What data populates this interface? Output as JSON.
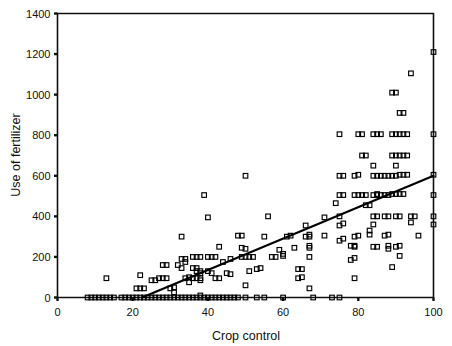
{
  "chart_data": {
    "type": "scatter",
    "title": "",
    "xlabel": "Crop control",
    "ylabel": "Use of fertilizer",
    "xlim": [
      0,
      100
    ],
    "ylim": [
      0,
      1400
    ],
    "xticks": [
      0,
      20,
      40,
      60,
      80,
      100
    ],
    "yticks": [
      0,
      200,
      400,
      600,
      800,
      1000,
      1200,
      1400
    ],
    "xtick_labels": [
      "0",
      "20",
      "40",
      "60",
      "80",
      "100"
    ],
    "ytick_labels": [
      "0",
      "200",
      "400",
      "600",
      "800",
      "1000",
      "1200",
      "1400"
    ],
    "grid": false,
    "legend": null,
    "marker": "open-square",
    "marker_color": "#000000",
    "trendline": {
      "label": "linear fit",
      "color": "#000000",
      "x_start": 22.5,
      "y_start": 0,
      "x_end": 100,
      "y_end": 600
    },
    "points": [
      [
        8,
        0
      ],
      [
        9,
        0
      ],
      [
        10,
        0
      ],
      [
        11,
        0
      ],
      [
        12,
        0
      ],
      [
        13,
        0
      ],
      [
        14,
        0
      ],
      [
        15,
        0
      ],
      [
        13,
        95
      ],
      [
        17,
        0
      ],
      [
        18,
        0
      ],
      [
        19,
        0
      ],
      [
        20,
        0
      ],
      [
        21,
        0
      ],
      [
        22,
        0
      ],
      [
        23,
        0
      ],
      [
        24,
        0
      ],
      [
        21,
        45
      ],
      [
        22,
        45
      ],
      [
        23,
        45
      ],
      [
        22,
        110
      ],
      [
        25,
        0
      ],
      [
        26,
        0
      ],
      [
        27,
        0
      ],
      [
        28,
        0
      ],
      [
        29,
        0
      ],
      [
        30,
        0
      ],
      [
        31,
        0
      ],
      [
        32,
        0
      ],
      [
        25,
        85
      ],
      [
        26,
        85
      ],
      [
        27,
        95
      ],
      [
        28,
        95
      ],
      [
        29,
        95
      ],
      [
        28,
        160
      ],
      [
        29,
        160
      ],
      [
        30,
        45
      ],
      [
        31,
        50
      ],
      [
        31,
        25
      ],
      [
        32,
        160
      ],
      [
        33,
        145
      ],
      [
        33,
        0
      ],
      [
        34,
        0
      ],
      [
        35,
        0
      ],
      [
        36,
        0
      ],
      [
        37,
        0
      ],
      [
        38,
        0
      ],
      [
        33,
        300
      ],
      [
        33,
        190
      ],
      [
        34,
        190
      ],
      [
        34,
        175
      ],
      [
        34,
        95
      ],
      [
        35,
        100
      ],
      [
        35,
        75
      ],
      [
        36,
        200
      ],
      [
        37,
        200
      ],
      [
        38,
        200
      ],
      [
        36,
        145
      ],
      [
        37,
        145
      ],
      [
        37,
        130
      ],
      [
        38,
        130
      ],
      [
        38,
        120
      ],
      [
        36,
        95
      ],
      [
        37,
        95
      ],
      [
        38,
        95
      ],
      [
        38,
        85
      ],
      [
        38,
        10
      ],
      [
        39,
        0
      ],
      [
        40,
        0
      ],
      [
        41,
        0
      ],
      [
        42,
        0
      ],
      [
        43,
        0
      ],
      [
        39,
        505
      ],
      [
        40,
        395
      ],
      [
        40,
        200
      ],
      [
        41,
        200
      ],
      [
        42,
        200
      ],
      [
        40,
        130
      ],
      [
        41,
        120
      ],
      [
        42,
        95
      ],
      [
        43,
        95
      ],
      [
        43,
        250
      ],
      [
        44,
        0
      ],
      [
        45,
        0
      ],
      [
        46,
        0
      ],
      [
        47,
        0
      ],
      [
        44,
        175
      ],
      [
        45,
        120
      ],
      [
        46,
        115
      ],
      [
        46,
        190
      ],
      [
        48,
        305
      ],
      [
        49,
        305
      ],
      [
        50,
        600
      ],
      [
        48,
        0
      ],
      [
        50,
        0
      ],
      [
        49,
        200
      ],
      [
        50,
        200
      ],
      [
        51,
        200
      ],
      [
        52,
        200
      ],
      [
        49,
        245
      ],
      [
        50,
        240
      ],
      [
        50,
        60
      ],
      [
        51,
        130
      ],
      [
        53,
        140
      ],
      [
        54,
        145
      ],
      [
        53,
        0
      ],
      [
        55,
        0
      ],
      [
        55,
        300
      ],
      [
        56,
        400
      ],
      [
        57,
        200
      ],
      [
        58,
        200
      ],
      [
        59,
        235
      ],
      [
        60,
        205
      ],
      [
        60,
        215
      ],
      [
        60,
        0
      ],
      [
        61,
        300
      ],
      [
        62,
        305
      ],
      [
        63,
        245
      ],
      [
        64,
        140
      ],
      [
        65,
        140
      ],
      [
        64,
        95
      ],
      [
        65,
        100
      ],
      [
        66,
        355
      ],
      [
        66,
        300
      ],
      [
        67,
        300
      ],
      [
        67,
        310
      ],
      [
        67,
        245
      ],
      [
        67,
        255
      ],
      [
        67,
        200
      ],
      [
        67,
        45
      ],
      [
        68,
        0
      ],
      [
        71,
        395
      ],
      [
        71,
        305
      ],
      [
        73,
        0
      ],
      [
        74,
        465
      ],
      [
        75,
        400
      ],
      [
        75,
        0
      ],
      [
        75,
        805
      ],
      [
        75,
        600
      ],
      [
        76,
        600
      ],
      [
        75,
        505
      ],
      [
        76,
        505
      ],
      [
        75,
        355
      ],
      [
        76,
        365
      ],
      [
        75,
        280
      ],
      [
        76,
        290
      ],
      [
        78,
        185
      ],
      [
        79,
        195
      ],
      [
        78,
        255
      ],
      [
        79,
        250
      ],
      [
        79,
        255
      ],
      [
        79,
        300
      ],
      [
        80,
        305
      ],
      [
        79,
        600
      ],
      [
        80,
        605
      ],
      [
        79,
        505
      ],
      [
        80,
        505
      ],
      [
        81,
        505
      ],
      [
        82,
        505
      ],
      [
        79,
        95
      ],
      [
        80,
        805
      ],
      [
        81,
        805
      ],
      [
        81,
        700
      ],
      [
        82,
        700
      ],
      [
        82,
        455
      ],
      [
        83,
        455
      ],
      [
        83,
        310
      ],
      [
        83,
        330
      ],
      [
        84,
        805
      ],
      [
        85,
        805
      ],
      [
        84,
        650
      ],
      [
        84,
        600
      ],
      [
        84,
        505
      ],
      [
        85,
        505
      ],
      [
        85,
        510
      ],
      [
        84,
        400
      ],
      [
        85,
        400
      ],
      [
        84,
        360
      ],
      [
        84,
        250
      ],
      [
        85,
        250
      ],
      [
        85,
        600
      ],
      [
        86,
        600
      ],
      [
        87,
        600
      ],
      [
        88,
        600
      ],
      [
        86,
        805
      ],
      [
        86,
        505
      ],
      [
        87,
        505
      ],
      [
        88,
        505
      ],
      [
        87,
        400
      ],
      [
        88,
        400
      ],
      [
        87,
        305
      ],
      [
        88,
        310
      ],
      [
        88,
        255
      ],
      [
        88,
        240
      ],
      [
        89,
        1010
      ],
      [
        90,
        1010
      ],
      [
        89,
        805
      ],
      [
        90,
        805
      ],
      [
        91,
        805
      ],
      [
        92,
        805
      ],
      [
        93,
        805
      ],
      [
        89,
        700
      ],
      [
        90,
        700
      ],
      [
        91,
        700
      ],
      [
        92,
        700
      ],
      [
        93,
        700
      ],
      [
        89,
        600
      ],
      [
        90,
        600
      ],
      [
        91,
        605
      ],
      [
        92,
        605
      ],
      [
        93,
        605
      ],
      [
        89,
        510
      ],
      [
        90,
        510
      ],
      [
        91,
        510
      ],
      [
        92,
        510
      ],
      [
        90,
        650
      ],
      [
        90,
        400
      ],
      [
        91,
        400
      ],
      [
        90,
        250
      ],
      [
        91,
        255
      ],
      [
        91,
        205
      ],
      [
        89,
        150
      ],
      [
        91,
        910
      ],
      [
        92,
        910
      ],
      [
        94,
        1105
      ],
      [
        94,
        400
      ],
      [
        95,
        400
      ],
      [
        94,
        370
      ],
      [
        96,
        305
      ],
      [
        100,
        1210
      ],
      [
        100,
        805
      ],
      [
        100,
        605
      ],
      [
        100,
        505
      ],
      [
        100,
        400
      ],
      [
        100,
        360
      ]
    ]
  },
  "axes": {
    "x_axis_name": "x-axis",
    "y_axis_name": "y-axis"
  }
}
